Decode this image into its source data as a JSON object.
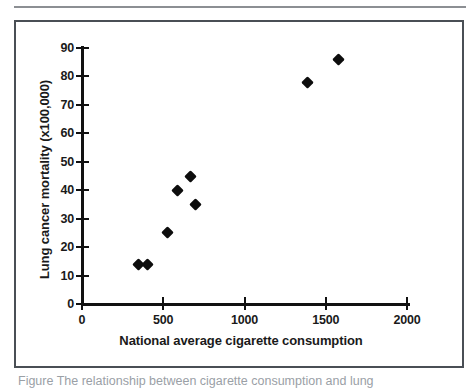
{
  "figure": {
    "caption": "Figure  The relationship between cigarette consumption and lung"
  },
  "chart_data": {
    "type": "scatter",
    "title": "",
    "xlabel": "National average cigarette consumption",
    "ylabel": "Lung cancer mortality (x100,000)",
    "xlim": [
      0,
      2000
    ],
    "ylim": [
      0,
      90
    ],
    "xticks": [
      0,
      500,
      1000,
      1500,
      2000
    ],
    "yticks": [
      0,
      10,
      20,
      30,
      40,
      50,
      60,
      70,
      80,
      90
    ],
    "xtick_labels": [
      "0",
      "500",
      "1000",
      "1500",
      "2000"
    ],
    "ytick_labels": [
      "0",
      "10",
      "20",
      "30",
      "40",
      "50",
      "60",
      "70",
      "80",
      "90"
    ],
    "grid": false,
    "legend": null,
    "marker": "diamond",
    "marker_color": "#0d0d0d",
    "points": [
      {
        "x": 350,
        "y": 14
      },
      {
        "x": 400,
        "y": 14
      },
      {
        "x": 525,
        "y": 25
      },
      {
        "x": 590,
        "y": 40
      },
      {
        "x": 670,
        "y": 45
      },
      {
        "x": 700,
        "y": 35
      },
      {
        "x": 1390,
        "y": 78
      },
      {
        "x": 1580,
        "y": 86
      }
    ]
  },
  "colors": {
    "border": "#4a4f55",
    "rule": "#8c8f93",
    "axis": "#111111",
    "text": "#1a1a1a",
    "caption": "#9aa0a6"
  }
}
